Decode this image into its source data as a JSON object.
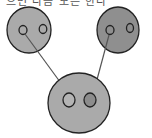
{
  "caption": "으면 다음 모든 한다",
  "diagram": {
    "parents": [
      {
        "id": "left-parent",
        "fill": "#aaaaaa",
        "inner": [
          "#aaaaaa",
          "#aaaaaa"
        ]
      },
      {
        "id": "right-parent",
        "fill": "#8f8f8f",
        "inner": [
          "#8f8f8f",
          "#8f8f8f"
        ]
      }
    ],
    "child": {
      "id": "child",
      "fill": "#aaaaaa",
      "inner": [
        "#b4b4b4",
        "#8c8c8c"
      ]
    },
    "arrows": [
      {
        "from": "left-parent",
        "to": "child"
      },
      {
        "from": "right-parent",
        "to": "child"
      }
    ],
    "stroke": "#222222",
    "arrow_color": "#555555"
  }
}
